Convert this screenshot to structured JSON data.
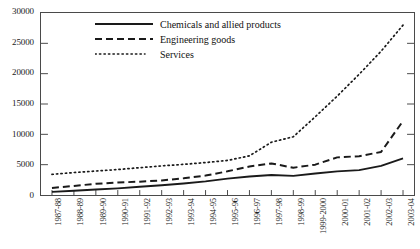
{
  "chart_data": {
    "type": "line",
    "title": "",
    "subtitle": "",
    "xlabel": "",
    "ylabel": "",
    "ylim": [
      0,
      30000
    ],
    "ytick_step": 5000,
    "yticks": [
      0,
      5000,
      10000,
      15000,
      20000,
      25000,
      30000
    ],
    "ytick_labels": [
      "0",
      "5000",
      "10000",
      "15000",
      "20000",
      "25000",
      "30000"
    ],
    "grid": false,
    "legend_position": "top-left-inside",
    "categories": [
      "1987-88",
      "1988-89",
      "1989-90",
      "1990-91",
      "1991-92",
      "1992-93",
      "1993-94",
      "1994-95",
      "1995-96",
      "1996-97",
      "1997-98",
      "1998-99",
      "1999-2000",
      "2000-01",
      "2001-02",
      "2002-03",
      "2003-04"
    ],
    "series": [
      {
        "name": "Chemicals and allied products",
        "style": "solid",
        "color": "#1a1a1a",
        "values": [
          520,
          700,
          900,
          1100,
          1350,
          1600,
          1900,
          2250,
          2700,
          3050,
          3300,
          3150,
          3550,
          3900,
          4100,
          4800,
          6050
        ]
      },
      {
        "name": "Engineering goods",
        "style": "dashed",
        "color": "#1a1a1a",
        "values": [
          1150,
          1500,
          1850,
          2050,
          2200,
          2400,
          2750,
          3200,
          3900,
          4700,
          5200,
          4500,
          5000,
          6200,
          6400,
          7100,
          12200
        ]
      },
      {
        "name": "Services",
        "style": "dotted",
        "color": "#1a1a1a",
        "values": [
          3400,
          3700,
          3950,
          4200,
          4500,
          4800,
          5050,
          5350,
          5700,
          6450,
          8700,
          9600,
          12900,
          16300,
          19900,
          23700,
          28000
        ]
      }
    ]
  },
  "legend": {
    "items": [
      {
        "label": "Chemicals and allied products",
        "style": "solid"
      },
      {
        "label": "Engineering goods",
        "style": "dashed"
      },
      {
        "label": "Services",
        "style": "dotted"
      }
    ]
  }
}
